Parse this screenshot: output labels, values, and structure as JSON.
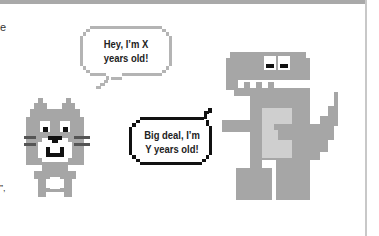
{
  "scene": {
    "colors": {
      "background": "#ffffff",
      "top_bar": "#a9a9a9",
      "border": "#c8c8c8",
      "character_gray": "#a6a6a6",
      "belly": "#cfcfcf",
      "ink": "#111111",
      "bubble1_outline": "#b4b4b4",
      "bubble2_outline": "#111111"
    },
    "edge_fragments": {
      "top_left": "e",
      "bottom_left": "”,"
    },
    "cat": {
      "label": "pixel cat",
      "bubble": {
        "line1": "Hey, I’m X",
        "line2": "years old!"
      }
    },
    "dinosaur": {
      "label": "pixel dinosaur",
      "bubble": {
        "line1": "Big deal, I’m",
        "line2": "Y years old!"
      }
    }
  }
}
